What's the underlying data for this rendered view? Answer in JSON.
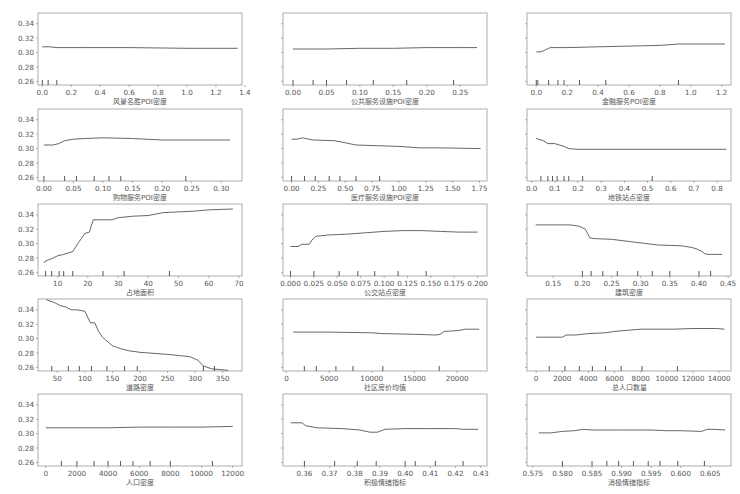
{
  "figure": {
    "width": 740,
    "height": 494,
    "line_color": "#555555",
    "frame_color": "#999999",
    "text_color": "#555555"
  },
  "layout": {
    "col_x": [
      38,
      283,
      527
    ],
    "row_y": [
      13,
      109,
      204,
      299,
      394
    ],
    "plot_w": 204,
    "plot_h": 72,
    "ylim": [
      0.255,
      0.355
    ],
    "yticks": [
      0.26,
      0.28,
      0.3,
      0.32,
      0.34
    ],
    "ytick_labels": [
      "0.26",
      "0.28",
      "0.30",
      "0.32",
      "0.34"
    ]
  },
  "chart_data": [
    {
      "type": "line",
      "title": "",
      "xlabel": "风景名胜POI密度",
      "ylabel": "",
      "row": 0,
      "col": 0,
      "show_ylabels": true,
      "xlim": [
        -0.03,
        1.38
      ],
      "xticks": [
        0.0,
        0.2,
        0.4,
        0.6,
        0.8,
        1.0,
        1.2,
        1.4
      ],
      "xtick_labels": [
        "0.0",
        "0.2",
        "0.4",
        "0.6",
        "0.8",
        "1.0",
        "1.2",
        "1.4"
      ],
      "rug": [
        0.0,
        0.04,
        0.1
      ],
      "x": [
        0.0,
        0.05,
        0.1,
        0.3,
        0.6,
        1.0,
        1.35
      ],
      "y": [
        0.308,
        0.308,
        0.307,
        0.307,
        0.307,
        0.306,
        0.306
      ]
    },
    {
      "type": "line",
      "title": "",
      "xlabel": "公共服务设施POI密度",
      "ylabel": "",
      "row": 0,
      "col": 1,
      "show_ylabels": false,
      "xlim": [
        -0.015,
        0.29
      ],
      "xticks": [
        0.0,
        0.05,
        0.1,
        0.15,
        0.2,
        0.25
      ],
      "xtick_labels": [
        "0.00",
        "0.05",
        "0.10",
        "0.15",
        "0.20",
        "0.25"
      ],
      "rug": [
        0.0,
        0.03,
        0.05,
        0.08,
        0.12,
        0.17,
        0.24
      ],
      "x": [
        0.0,
        0.05,
        0.1,
        0.15,
        0.2,
        0.25,
        0.275
      ],
      "y": [
        0.305,
        0.305,
        0.306,
        0.306,
        0.307,
        0.307,
        0.307
      ]
    },
    {
      "type": "line",
      "title": "",
      "xlabel": "金融服务POI密度",
      "ylabel": "",
      "row": 0,
      "col": 2,
      "show_ylabels": false,
      "xlim": [
        -0.06,
        1.26
      ],
      "xticks": [
        0.0,
        0.2,
        0.4,
        0.6,
        0.8,
        1.0,
        1.2
      ],
      "xtick_labels": [
        "0.0",
        "0.2",
        "0.4",
        "0.6",
        "0.8",
        "1.0",
        "1.2"
      ],
      "rug": [
        0.0,
        0.01,
        0.08,
        0.14,
        0.18,
        0.28,
        0.45,
        0.92
      ],
      "x": [
        0.0,
        0.03,
        0.06,
        0.09,
        0.2,
        0.4,
        0.6,
        0.8,
        0.92,
        1.0,
        1.22
      ],
      "y": [
        0.301,
        0.301,
        0.304,
        0.307,
        0.307,
        0.308,
        0.309,
        0.31,
        0.312,
        0.312,
        0.312
      ]
    },
    {
      "type": "line",
      "title": "",
      "xlabel": "购物服务POI密度",
      "ylabel": "",
      "row": 1,
      "col": 0,
      "show_ylabels": true,
      "xlim": [
        -0.01,
        0.335
      ],
      "xticks": [
        0.0,
        0.05,
        0.1,
        0.15,
        0.2,
        0.25,
        0.3
      ],
      "xtick_labels": [
        "0.00",
        "0.05",
        "0.10",
        "0.15",
        "0.20",
        "0.25",
        "0.30"
      ],
      "rug": [
        0.0,
        0.035,
        0.055,
        0.085,
        0.11,
        0.13,
        0.24
      ],
      "x": [
        0.0,
        0.015,
        0.025,
        0.035,
        0.05,
        0.07,
        0.1,
        0.15,
        0.2,
        0.25,
        0.315
      ],
      "y": [
        0.305,
        0.305,
        0.307,
        0.311,
        0.313,
        0.314,
        0.315,
        0.314,
        0.312,
        0.312,
        0.312
      ]
    },
    {
      "type": "line",
      "title": "",
      "xlabel": "医疗服务设施POI密度",
      "ylabel": "",
      "row": 1,
      "col": 1,
      "show_ylabels": false,
      "xlim": [
        -0.08,
        1.82
      ],
      "xticks": [
        0.0,
        0.25,
        0.5,
        0.75,
        1.0,
        1.25,
        1.5,
        1.75
      ],
      "xtick_labels": [
        "0.00",
        "0.25",
        "0.50",
        "0.75",
        "1.00",
        "1.25",
        "1.50",
        "1.75"
      ],
      "rug": [
        0.0,
        0.12,
        0.22,
        0.35,
        0.45,
        0.6,
        0.82
      ],
      "x": [
        0.0,
        0.05,
        0.1,
        0.2,
        0.4,
        0.5,
        0.6,
        0.8,
        1.0,
        1.2,
        1.4,
        1.76
      ],
      "y": [
        0.313,
        0.313,
        0.315,
        0.312,
        0.311,
        0.308,
        0.305,
        0.304,
        0.303,
        0.301,
        0.301,
        0.3
      ]
    },
    {
      "type": "line",
      "title": "",
      "xlabel": "地铁站点密度",
      "ylabel": "",
      "row": 1,
      "col": 2,
      "show_ylabels": false,
      "xlim": [
        -0.02,
        0.86
      ],
      "xticks": [
        0.0,
        0.1,
        0.2,
        0.3,
        0.4,
        0.5,
        0.6,
        0.7,
        0.8
      ],
      "xtick_labels": [
        "0.0",
        "0.1",
        "0.2",
        "0.3",
        "0.4",
        "0.5",
        "0.6",
        "0.7",
        "0.8"
      ],
      "rug": [
        0.04,
        0.07,
        0.09,
        0.11,
        0.14,
        0.16,
        0.22,
        0.52
      ],
      "x": [
        0.02,
        0.05,
        0.07,
        0.1,
        0.12,
        0.14,
        0.16,
        0.2,
        0.3,
        0.5,
        0.84
      ],
      "y": [
        0.314,
        0.311,
        0.307,
        0.307,
        0.305,
        0.303,
        0.3,
        0.299,
        0.299,
        0.299,
        0.299
      ]
    },
    {
      "type": "line",
      "title": "",
      "xlabel": "占地面积",
      "ylabel": "",
      "row": 2,
      "col": 0,
      "show_ylabels": true,
      "xlim": [
        3.5,
        71
      ],
      "xticks": [
        10,
        20,
        30,
        40,
        50,
        60,
        70
      ],
      "xtick_labels": [
        "10",
        "20",
        "30",
        "40",
        "50",
        "60",
        "70"
      ],
      "rug": [
        6,
        8,
        10.5,
        12,
        15,
        25,
        32,
        47
      ],
      "x": [
        5.5,
        6,
        8,
        10,
        12,
        15,
        17,
        19,
        20.5,
        21,
        21.8,
        25,
        28,
        30,
        35,
        40,
        45,
        50,
        55,
        60,
        68
      ],
      "y": [
        0.273,
        0.276,
        0.279,
        0.283,
        0.285,
        0.289,
        0.302,
        0.314,
        0.316,
        0.323,
        0.333,
        0.333,
        0.333,
        0.336,
        0.338,
        0.339,
        0.343,
        0.344,
        0.345,
        0.347,
        0.348
      ]
    },
    {
      "type": "line",
      "title": "",
      "xlabel": "公交站点密度",
      "ylabel": "",
      "row": 2,
      "col": 1,
      "show_ylabels": false,
      "xlim": [
        -0.008,
        0.21
      ],
      "xticks": [
        0.0,
        0.025,
        0.05,
        0.075,
        0.1,
        0.125,
        0.15,
        0.175,
        0.2
      ],
      "xtick_labels": [
        "0.000",
        "0.025",
        "0.050",
        "0.075",
        "0.100",
        "0.125",
        "0.150",
        "0.175",
        "0.200"
      ],
      "rug": [
        0.0,
        0.025,
        0.052,
        0.072,
        0.09,
        0.115,
        0.145
      ],
      "x": [
        0.0,
        0.008,
        0.012,
        0.02,
        0.023,
        0.027,
        0.04,
        0.06,
        0.08,
        0.1,
        0.12,
        0.14,
        0.16,
        0.18,
        0.2
      ],
      "y": [
        0.296,
        0.296,
        0.299,
        0.299,
        0.305,
        0.31,
        0.312,
        0.313,
        0.315,
        0.317,
        0.318,
        0.318,
        0.317,
        0.316,
        0.316
      ]
    },
    {
      "type": "line",
      "title": "",
      "xlabel": "建筑密度",
      "ylabel": "",
      "row": 2,
      "col": 2,
      "show_ylabels": false,
      "xlim": [
        0.105,
        0.455
      ],
      "xticks": [
        0.15,
        0.2,
        0.25,
        0.3,
        0.35,
        0.4,
        0.45
      ],
      "xtick_labels": [
        "0.15",
        "0.20",
        "0.25",
        "0.30",
        "0.35",
        "0.40",
        "0.45"
      ],
      "rug": [
        0.2,
        0.215,
        0.235,
        0.26,
        0.295,
        0.32,
        0.35,
        0.4,
        0.42
      ],
      "x": [
        0.12,
        0.18,
        0.195,
        0.205,
        0.213,
        0.22,
        0.25,
        0.3,
        0.33,
        0.37,
        0.385,
        0.395,
        0.405,
        0.41,
        0.415,
        0.44
      ],
      "y": [
        0.326,
        0.326,
        0.324,
        0.32,
        0.308,
        0.307,
        0.306,
        0.301,
        0.298,
        0.297,
        0.295,
        0.293,
        0.289,
        0.286,
        0.285,
        0.285
      ]
    },
    {
      "type": "line",
      "title": "",
      "xlabel": "道路密度",
      "ylabel": "",
      "row": 3,
      "col": 0,
      "show_ylabels": true,
      "xlim": [
        15,
        385
      ],
      "xticks": [
        50,
        100,
        150,
        200,
        250,
        300,
        350
      ],
      "xtick_labels": [
        "50",
        "100",
        "150",
        "200",
        "250",
        "300",
        "350"
      ],
      "rug": [
        40,
        70,
        90,
        112,
        140,
        172,
        195,
        315,
        335
      ],
      "x": [
        30,
        45,
        55,
        65,
        75,
        85,
        100,
        110,
        118,
        125,
        132,
        138,
        150,
        165,
        180,
        200,
        250,
        290,
        305,
        315,
        330,
        360
      ],
      "y": [
        0.354,
        0.35,
        0.346,
        0.344,
        0.34,
        0.34,
        0.338,
        0.322,
        0.322,
        0.31,
        0.302,
        0.298,
        0.29,
        0.286,
        0.283,
        0.281,
        0.278,
        0.275,
        0.27,
        0.262,
        0.258,
        0.256
      ]
    },
    {
      "type": "line",
      "title": "",
      "xlabel": "社区房价均值",
      "ylabel": "",
      "row": 3,
      "col": 1,
      "show_ylabels": false,
      "xlim": [
        -400,
        23500
      ],
      "xticks": [
        0,
        5000,
        10000,
        15000,
        20000
      ],
      "xtick_labels": [
        "0",
        "5000",
        "10000",
        "15000",
        "20000"
      ],
      "rug": [
        2100,
        3500,
        5800,
        7800,
        11300,
        17900
      ],
      "x": [
        800,
        5000,
        10000,
        11300,
        15000,
        17500,
        18000,
        18500,
        20000,
        21000,
        22600
      ],
      "y": [
        0.309,
        0.309,
        0.308,
        0.307,
        0.306,
        0.305,
        0.306,
        0.31,
        0.311,
        0.313,
        0.313
      ]
    },
    {
      "type": "line",
      "title": "",
      "xlabel": "总人口数量",
      "ylabel": "",
      "row": 3,
      "col": 2,
      "show_ylabels": false,
      "xlim": [
        -700,
        14900
      ],
      "xticks": [
        0,
        2000,
        4000,
        6000,
        8000,
        10000,
        12000,
        14000
      ],
      "xtick_labels": [
        "0",
        "2000",
        "4000",
        "6000",
        "8000",
        "10000",
        "12000",
        "14000"
      ],
      "rug": [
        1000,
        2200,
        3300,
        4300,
        5300,
        6500,
        8100,
        10800
      ],
      "x": [
        0,
        2000,
        2300,
        3000,
        4000,
        5300,
        6000,
        8000,
        9000,
        10500,
        12000,
        13800,
        14400
      ],
      "y": [
        0.302,
        0.302,
        0.305,
        0.305,
        0.307,
        0.308,
        0.31,
        0.313,
        0.313,
        0.313,
        0.314,
        0.314,
        0.313
      ]
    },
    {
      "type": "line",
      "title": "",
      "xlabel": "人口密度",
      "ylabel": "",
      "row": 4,
      "col": 0,
      "show_ylabels": true,
      "xlim": [
        -500,
        12600
      ],
      "xticks": [
        0,
        2000,
        4000,
        6000,
        8000,
        10000,
        12000
      ],
      "xtick_labels": [
        "0",
        "2000",
        "4000",
        "6000",
        "8000",
        "10000",
        "12000"
      ],
      "rug": [
        1000,
        2000,
        3100,
        4000,
        4800,
        5600,
        6700,
        8000,
        10700
      ],
      "x": [
        0,
        2000,
        4000,
        6000,
        8000,
        10000,
        12000
      ],
      "y": [
        0.308,
        0.308,
        0.308,
        0.309,
        0.309,
        0.309,
        0.31
      ]
    },
    {
      "type": "line",
      "title": "",
      "xlabel": "积极情绪指标",
      "ylabel": "",
      "row": 4,
      "col": 1,
      "show_ylabels": false,
      "xlim": [
        0.3515,
        0.4325
      ],
      "xticks": [
        0.36,
        0.37,
        0.38,
        0.39,
        0.4,
        0.41,
        0.42,
        0.43
      ],
      "xtick_labels": [
        "0.36",
        "0.37",
        "0.38",
        "0.39",
        "0.40",
        "0.41",
        "0.42",
        "0.43"
      ],
      "rug": [
        0.36,
        0.372,
        0.381,
        0.3885,
        0.4,
        0.404,
        0.412,
        0.423
      ],
      "x": [
        0.3545,
        0.359,
        0.3605,
        0.365,
        0.375,
        0.382,
        0.386,
        0.389,
        0.392,
        0.4,
        0.41,
        0.42,
        0.423,
        0.429
      ],
      "y": [
        0.315,
        0.315,
        0.311,
        0.308,
        0.307,
        0.305,
        0.302,
        0.302,
        0.306,
        0.307,
        0.307,
        0.307,
        0.306,
        0.306
      ]
    },
    {
      "type": "line",
      "title": "",
      "xlabel": "消极情绪指标",
      "ylabel": "",
      "row": 4,
      "col": 2,
      "show_ylabels": false,
      "xlim": [
        0.574,
        0.6085
      ],
      "xticks": [
        0.575,
        0.58,
        0.585,
        0.59,
        0.595,
        0.6,
        0.605
      ],
      "xtick_labels": [
        "0.575",
        "0.580",
        "0.585",
        "0.590",
        "0.595",
        "0.600",
        "0.605"
      ],
      "rug": [
        0.58,
        0.585,
        0.5875,
        0.5895,
        0.592,
        0.5945,
        0.5965,
        0.5995,
        0.604
      ],
      "x": [
        0.576,
        0.578,
        0.58,
        0.582,
        0.5835,
        0.585,
        0.59,
        0.595,
        0.5975,
        0.6,
        0.6035,
        0.6045,
        0.6055,
        0.6075
      ],
      "y": [
        0.301,
        0.301,
        0.303,
        0.304,
        0.306,
        0.305,
        0.305,
        0.305,
        0.304,
        0.304,
        0.303,
        0.306,
        0.306,
        0.305
      ]
    }
  ]
}
